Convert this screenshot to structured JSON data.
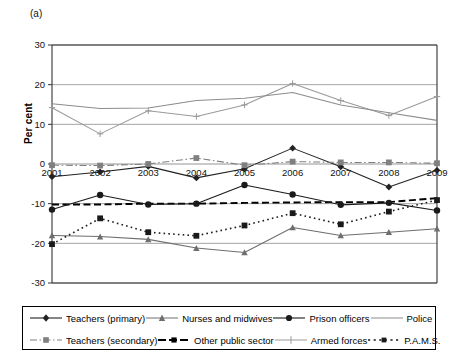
{
  "figure": {
    "panel_label": "(a)",
    "ylabel": "Per cent"
  },
  "chart_data": {
    "type": "line",
    "title": "",
    "xlabel": "",
    "ylabel": "Per cent",
    "x": [
      2001,
      2002,
      2003,
      2004,
      2005,
      2006,
      2007,
      2008,
      2009
    ],
    "categories": [
      "2001",
      "2002",
      "2003",
      "2004",
      "2005",
      "2006",
      "2007",
      "2008",
      "2009"
    ],
    "ylim": [
      -30,
      30
    ],
    "yticks": [
      30,
      20,
      10,
      0,
      -10,
      -20,
      -30
    ],
    "ytick_labels": [
      "30",
      "20",
      "10",
      "0",
      "-10",
      "-20",
      "-30"
    ],
    "grid": true,
    "legend_position": "below",
    "series": [
      {
        "name": "Teachers (primary)",
        "color": "#222222",
        "marker": "diamond",
        "dash": "solid",
        "values": [
          -3.2,
          -2.0,
          -0.6,
          -3.5,
          -1.2,
          4.0,
          -0.7,
          -5.8,
          -1.6
        ]
      },
      {
        "name": "Teachers (secondary)",
        "color": "#808080",
        "marker": "square",
        "dash": "dashdot",
        "values": [
          -0.3,
          -0.4,
          0.0,
          1.5,
          -0.3,
          0.6,
          0.4,
          0.4,
          0.2
        ]
      },
      {
        "name": "Nurses and midwives",
        "color": "#6e6e6e",
        "marker": "triangle",
        "dash": "solid",
        "values": [
          -18.0,
          -18.3,
          -19.0,
          -21.2,
          -22.3,
          -16.0,
          -18.0,
          -17.2,
          -16.3
        ]
      },
      {
        "name": "Other public sector",
        "color": "#000000",
        "marker": "none",
        "dash": "dashed",
        "values": [
          -10.2,
          -10.2,
          -10.0,
          -10.0,
          -9.8,
          -9.7,
          -9.6,
          -9.6,
          -8.6
        ]
      },
      {
        "name": "Prison officers",
        "color": "#1a1a1a",
        "marker": "circle",
        "dash": "solid",
        "values": [
          -11.5,
          -7.8,
          -10.2,
          -10.0,
          -5.3,
          -7.7,
          -10.3,
          -9.8,
          -11.7
        ]
      },
      {
        "name": "Armed forces",
        "color": "#9a9a9a",
        "marker": "plus",
        "dash": "solid",
        "values": [
          14.2,
          7.6,
          13.4,
          12.0,
          14.9,
          20.3,
          16.0,
          12.2,
          17.0
        ]
      },
      {
        "name": "Police",
        "color": "#8c8c8c",
        "marker": "none",
        "dash": "solid",
        "values": [
          15.2,
          14.0,
          14.1,
          16.0,
          16.6,
          18.0,
          14.9,
          12.9,
          11.0
        ]
      },
      {
        "name": "P.A.M.S.",
        "color": "#1a1a1a",
        "marker": "square",
        "dash": "dotted",
        "values": [
          -20.2,
          -13.7,
          -17.2,
          -18.1,
          -15.5,
          -12.4,
          -15.2,
          -12.0,
          -9.1
        ]
      }
    ]
  },
  "legend": {
    "row1": [
      {
        "label": "Teachers (primary)",
        "key": "teachers-primary"
      },
      {
        "label": "Nurses and midwives",
        "key": "nurses-and-midwives"
      },
      {
        "label": "Prison officers",
        "key": "prison-officers"
      },
      {
        "label": "Police",
        "key": "police"
      }
    ],
    "row2": [
      {
        "label": "Teachers (secondary)",
        "key": "teachers-secondary"
      },
      {
        "label": "Other public sector",
        "key": "other-public-sector"
      },
      {
        "label": "Armed forces",
        "key": "armed-forces"
      },
      {
        "label": "P.A.M.S.",
        "key": "pams"
      }
    ]
  }
}
